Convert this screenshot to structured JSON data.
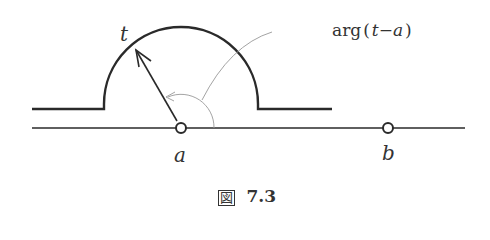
{
  "figure": {
    "caption_prefix": "図",
    "caption_number": "7.3"
  },
  "labels": {
    "t": "t",
    "a": "a",
    "b": "b",
    "arg_prefix": "arg",
    "arg_open": "(",
    "arg_t": "t",
    "arg_minus": "−",
    "arg_a": "a",
    "arg_close": ")"
  },
  "colors": {
    "stroke": "#2a2a2a",
    "thin": "#999999"
  }
}
